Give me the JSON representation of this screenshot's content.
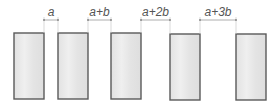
{
  "diagram": {
    "colors": {
      "rect_fill_light": "#ececec",
      "rect_fill_dark": "#d9d9d9",
      "rect_stroke": "#5a5a5a",
      "dim_line": "#9a9a9a",
      "label": "#555555"
    },
    "rects": [
      {
        "x": 14,
        "y": 33,
        "w": 30,
        "h": 66
      },
      {
        "x": 58,
        "y": 33,
        "w": 30,
        "h": 66
      },
      {
        "x": 111,
        "y": 33,
        "w": 30,
        "h": 66
      },
      {
        "x": 170,
        "y": 34,
        "w": 30,
        "h": 66
      },
      {
        "x": 236,
        "y": 34,
        "w": 30,
        "h": 66
      }
    ],
    "gaps": [
      {
        "label": "a",
        "x1": 44,
        "x2": 58,
        "y": 20,
        "label_x": 51
      },
      {
        "label": "a+b",
        "x1": 88,
        "x2": 111,
        "y": 20,
        "label_x": 99.5
      },
      {
        "label": "a+2b",
        "x1": 141,
        "x2": 170,
        "y": 20,
        "label_x": 155.5
      },
      {
        "label": "a+3b",
        "x1": 200,
        "x2": 236,
        "y": 20,
        "label_x": 218
      }
    ]
  }
}
